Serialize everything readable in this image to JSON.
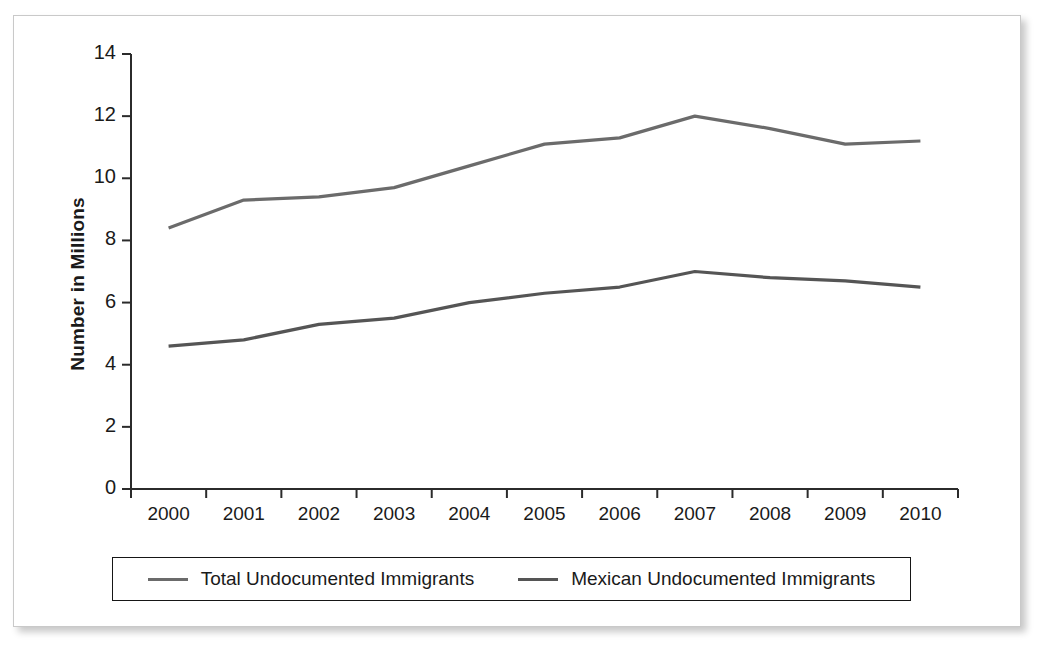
{
  "chart_data": {
    "type": "line",
    "title": "",
    "xlabel": "",
    "ylabel": "Number in Millions",
    "categories": [
      "2000",
      "2001",
      "2002",
      "2003",
      "2004",
      "2005",
      "2006",
      "2007",
      "2008",
      "2009",
      "2010"
    ],
    "ylim": [
      0,
      14
    ],
    "yticks": [
      0,
      2,
      4,
      6,
      8,
      10,
      12,
      14
    ],
    "ytick_labels": [
      "0",
      "2",
      "4",
      "6",
      "8",
      "10",
      "12",
      "14"
    ],
    "grid": false,
    "legend_position": "bottom",
    "series": [
      {
        "name": "Total Undocumented Immigrants",
        "color": "#6b6b6b",
        "values": [
          8.4,
          9.3,
          9.4,
          9.7,
          10.4,
          11.1,
          11.3,
          12.0,
          11.6,
          11.1,
          11.2
        ]
      },
      {
        "name": "Mexican Undocumented Immigrants",
        "color": "#555555",
        "values": [
          4.6,
          4.8,
          5.3,
          5.5,
          6.0,
          6.3,
          6.5,
          7.0,
          6.8,
          6.7,
          6.5
        ]
      }
    ]
  },
  "axis": {
    "y_title": "Number in Millions",
    "y_tick_labels": [
      "14",
      "12",
      "10",
      "8",
      "6",
      "4",
      "2",
      "0"
    ],
    "x_tick_labels": [
      "2000",
      "2001",
      "2002",
      "2003",
      "2004",
      "2005",
      "2006",
      "2007",
      "2008",
      "2009",
      "2010"
    ]
  },
  "legend": {
    "entries": [
      {
        "label": "Total Undocumented Immigrants"
      },
      {
        "label": "Mexican Undocumented Immigrants"
      }
    ]
  },
  "style": {
    "line_color_total": "#6b6b6b",
    "line_color_mexican": "#555555",
    "axis_color": "#2b2b2b",
    "text_color": "#1a1a1a",
    "frame_border": "#c9c9c9",
    "background": "#ffffff"
  }
}
